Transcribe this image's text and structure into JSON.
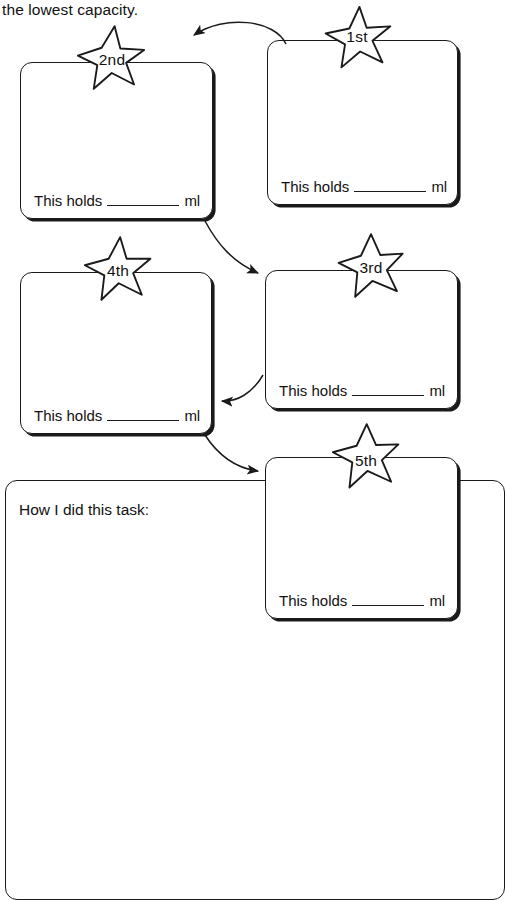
{
  "worksheet": {
    "instruction_text": "the lowest capacity.",
    "holds_prefix": "This holds",
    "holds_suffix": "ml",
    "reflection_label": "How I did this task:",
    "ink_color": "#1a1a1a",
    "page_background": "#ffffff"
  },
  "boxes": [
    {
      "rank_label": "1st",
      "holds_prefix": "This holds",
      "holds_suffix": "ml",
      "holds_value": ""
    },
    {
      "rank_label": "2nd",
      "holds_prefix": "This holds",
      "holds_suffix": "ml",
      "holds_value": ""
    },
    {
      "rank_label": "3rd",
      "holds_prefix": "This holds",
      "holds_suffix": "ml",
      "holds_value": ""
    },
    {
      "rank_label": "4th",
      "holds_prefix": "This holds",
      "holds_suffix": "ml",
      "holds_value": ""
    },
    {
      "rank_label": "5th",
      "holds_prefix": "This holds",
      "holds_suffix": "ml",
      "holds_value": ""
    }
  ],
  "flow": {
    "sequence": [
      "1st",
      "2nd",
      "3rd",
      "4th",
      "5th"
    ],
    "arrow_count": 4
  }
}
